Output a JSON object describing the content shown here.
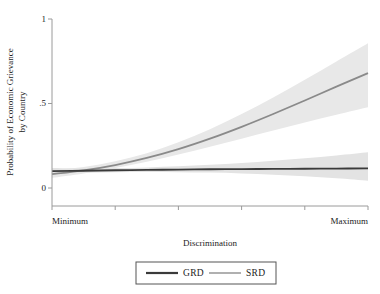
{
  "chart_data": {
    "type": "line",
    "title": "",
    "subtitle": "",
    "xlabel": "Discrimination",
    "ylabel": "Probability of Economic Grievance by Country",
    "ylabel_line1": "Probability of Economic Grievance",
    "ylabel_line2": "by Country",
    "grid": false,
    "legend_position": "bottom",
    "xlim": [
      0,
      1
    ],
    "ylim": [
      0,
      1
    ],
    "yticks": [
      0,
      0.5,
      1
    ],
    "ytick_labels": [
      "0",
      ".5",
      "1"
    ],
    "xticks": [
      0,
      0.2,
      0.4,
      0.6,
      0.8,
      1
    ],
    "xtick_labels": [
      "Minimum",
      "",
      "",
      "",
      "",
      "Maximum"
    ],
    "x": [
      0,
      0.1,
      0.2,
      0.3,
      0.4,
      0.5,
      0.6,
      0.7,
      0.8,
      0.9,
      1
    ],
    "series": [
      {
        "name": "GRD",
        "color": "#3a3a3a",
        "linewidth": 1.8,
        "values": [
          0.1,
          0.102,
          0.105,
          0.107,
          0.109,
          0.111,
          0.112,
          0.113,
          0.114,
          0.115,
          0.116
        ],
        "ci_lower": [
          0.085,
          0.09,
          0.093,
          0.094,
          0.093,
          0.091,
          0.086,
          0.079,
          0.069,
          0.057,
          0.043
        ],
        "ci_upper": [
          0.118,
          0.116,
          0.118,
          0.122,
          0.128,
          0.137,
          0.148,
          0.161,
          0.176,
          0.193,
          0.212
        ],
        "band_color": "#e3e3e3"
      },
      {
        "name": "SRD",
        "color": "#8a8a8a",
        "linewidth": 1.8,
        "values": [
          0.082,
          0.104,
          0.136,
          0.178,
          0.23,
          0.292,
          0.362,
          0.438,
          0.518,
          0.6,
          0.68
        ],
        "ci_lower": [
          0.06,
          0.086,
          0.118,
          0.156,
          0.198,
          0.244,
          0.292,
          0.34,
          0.388,
          0.434,
          0.478
        ],
        "ci_upper": [
          0.106,
          0.124,
          0.158,
          0.206,
          0.27,
          0.348,
          0.438,
          0.536,
          0.64,
          0.748,
          0.856
        ],
        "band_color": "#e8e8e8"
      }
    ],
    "legend": [
      {
        "label": "GRD",
        "color": "#3a3a3a"
      },
      {
        "label": "SRD",
        "color": "#9c9c9c"
      }
    ]
  },
  "axes": {
    "y_tick_0": "0",
    "y_tick_half": ".5",
    "y_tick_one": "1",
    "x_tick_min": "Minimum",
    "x_tick_max": "Maximum",
    "x_axis_title": "Discrimination",
    "y_axis_title_line1": "Probability of Economic Grievance",
    "y_axis_title_line2": "by Country"
  },
  "legend": {
    "item_1_label": "GRD",
    "item_2_label": "SRD"
  },
  "colors": {
    "grd_line": "#3a3a3a",
    "srd_line": "#9c9c9c",
    "band": "#e6e6e6",
    "axis": "#999999",
    "text": "#1c1c1c"
  }
}
